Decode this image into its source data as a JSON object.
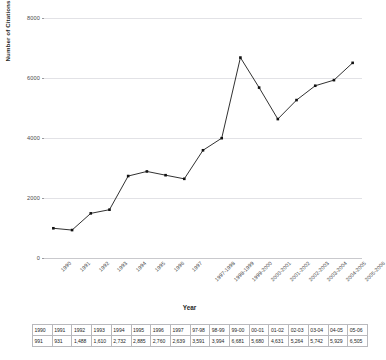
{
  "chart_data": {
    "type": "line",
    "title": "",
    "xlabel": "Year",
    "ylabel": "Number of Citations",
    "ylim": [
      0,
      8000
    ],
    "yticks": [
      0,
      2000,
      4000,
      6000,
      8000
    ],
    "ytick_labels": [
      "0",
      "2000",
      "4000",
      "6000",
      "8000"
    ],
    "grid": true,
    "legend": "none",
    "marker": "square",
    "line_color": "#1a1a1a",
    "marker_color": "#111111",
    "grid_color": "#e2e2e6",
    "categories": [
      "1990",
      "1991",
      "1992",
      "1993",
      "1994",
      "1995",
      "1996",
      "1997",
      "1997-1998",
      "1998-1999",
      "1999-2000",
      "2000-2001",
      "2001-2002",
      "2002-2003",
      "2003-2004",
      "2004-2005",
      "2005-2006"
    ],
    "values": [
      991,
      931,
      1488,
      1610,
      2732,
      2885,
      2760,
      2639,
      3591,
      3994,
      6681,
      5680,
      4631,
      5264,
      5742,
      5929,
      6505
    ]
  },
  "table": {
    "headers": [
      "1990",
      "1991",
      "1992",
      "1993",
      "1994",
      "1995",
      "1996",
      "1997",
      "97-98",
      "98-99",
      "99-00",
      "00-01",
      "01-02",
      "02-03",
      "03-04",
      "04-05",
      "05-06"
    ],
    "values": [
      "991",
      "931",
      "1,488",
      "1,610",
      "2,732",
      "2,885",
      "2,760",
      "2,639",
      "3,591",
      "3,994",
      "6,681",
      "5,680",
      "4,631",
      "5,264",
      "5,742",
      "5,929",
      "6,505"
    ]
  }
}
